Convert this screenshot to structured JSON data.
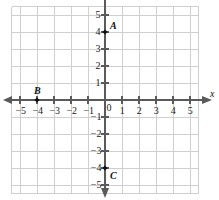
{
  "chart_data": {
    "type": "scatter",
    "title": "",
    "xlabel": "x",
    "ylabel": "",
    "xlim": [
      -5.5,
      5.5
    ],
    "ylim": [
      -5.5,
      5.5
    ],
    "grid": true,
    "legend": "none",
    "origin_label": "0",
    "x_ticks": [
      {
        "value": -5,
        "label": "−5"
      },
      {
        "value": -4,
        "label": "−4"
      },
      {
        "value": -3,
        "label": "−3"
      },
      {
        "value": -2,
        "label": "−2"
      },
      {
        "value": -1,
        "label": "−1"
      },
      {
        "value": 1,
        "label": "1"
      },
      {
        "value": 2,
        "label": "2"
      },
      {
        "value": 3,
        "label": "3"
      },
      {
        "value": 4,
        "label": "4"
      },
      {
        "value": 5,
        "label": "5"
      }
    ],
    "y_ticks": [
      {
        "value": 5,
        "label": "5"
      },
      {
        "value": 4,
        "label": "4"
      },
      {
        "value": 3,
        "label": "3"
      },
      {
        "value": 2,
        "label": "2"
      },
      {
        "value": 1,
        "label": "1"
      },
      {
        "value": -1,
        "label": "−1"
      },
      {
        "value": -2,
        "label": "−2"
      },
      {
        "value": -3,
        "label": "−3"
      },
      {
        "value": -4,
        "label": "−4"
      },
      {
        "value": -5,
        "label": "−5"
      }
    ],
    "points": [
      {
        "name": "A",
        "x": 0,
        "y": 4,
        "label_pos": "upper-right"
      },
      {
        "name": "B",
        "x": -4,
        "y": 0,
        "label_pos": "above"
      },
      {
        "name": "C",
        "x": 0,
        "y": -4,
        "label_pos": "lower-right"
      }
    ],
    "colors": {
      "grid": "#cfcfcf",
      "axis": "#5a5a5a",
      "point": "#101010",
      "text": "#1a1a1a",
      "background": "#ffffff"
    }
  }
}
